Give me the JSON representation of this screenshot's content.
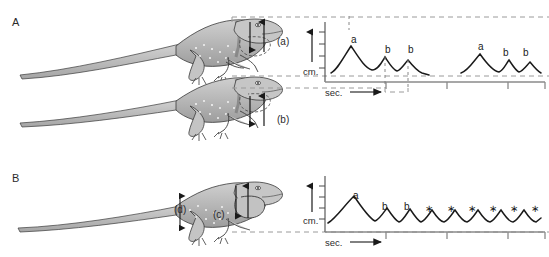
{
  "figure": {
    "background": "#ffffff",
    "ink": "#1a1a1a"
  },
  "panels": [
    {
      "id": "A",
      "label": "A",
      "lizards": [
        {
          "posture_label": "(a)",
          "description": "lizard-high-posture-with-dewlap-outline"
        },
        {
          "posture_label": "(b)",
          "description": "lizard-low-posture-with-dewlap-outline"
        }
      ]
    },
    {
      "id": "B",
      "label": "B",
      "lizards": [
        {
          "posture_label": "(d)",
          "dewlap_label": "(c)",
          "description": "lizard-body-height-and-dewlap-labelled"
        }
      ]
    }
  ],
  "labels": {
    "panel_a": "A",
    "panel_b": "B",
    "displacement_a": "(a)",
    "displacement_b": "(b)",
    "body_height_d": "(d)",
    "dewlap_c": "(c)"
  },
  "charts": {
    "top": {
      "ylabel": "cm.",
      "xlabel": "sec.",
      "xlabel_arrow": "→"
    },
    "bottom": {
      "ylabel": "cm.",
      "xlabel": "sec.",
      "xlabel_arrow": "→"
    }
  },
  "chart_data": [
    {
      "id": "top-trace",
      "type": "line",
      "title": "",
      "xlabel": "sec.",
      "ylabel": "cm.",
      "grid": false,
      "legend": null,
      "axis_origin_px": [
        325,
        82
      ],
      "y_ticks": 4,
      "x_ticks": [
        386,
        447,
        508
      ],
      "peak_labels": [
        "a",
        "b",
        "b",
        "a",
        "b",
        "b"
      ],
      "annotations": [
        {
          "text": "a",
          "x": 351,
          "y": 34,
          "group": 1
        },
        {
          "text": "b",
          "x": 385,
          "y": 44,
          "group": 1
        },
        {
          "text": "b",
          "x": 408,
          "y": 44,
          "group": 1
        },
        {
          "text": "a",
          "x": 478,
          "y": 41,
          "group": 2
        },
        {
          "text": "b",
          "x": 503,
          "y": 47,
          "group": 2
        },
        {
          "text": "b",
          "x": 523,
          "y": 47,
          "group": 2
        }
      ],
      "series": [
        {
          "name": "bob-display-burst-1",
          "points": [
            [
              332,
              72
            ],
            [
              338,
              66
            ],
            [
              344,
              55
            ],
            [
              351,
              46
            ],
            [
              358,
              55
            ],
            [
              365,
              66
            ],
            [
              372,
              70
            ],
            [
              379,
              66
            ],
            [
              385,
              57
            ],
            [
              391,
              66
            ],
            [
              397,
              71
            ],
            [
              403,
              67
            ],
            [
              408,
              60
            ],
            [
              414,
              67
            ],
            [
              421,
              72
            ],
            [
              428,
              74
            ]
          ]
        },
        {
          "name": "bob-display-burst-2",
          "points": [
            [
              462,
              72
            ],
            [
              468,
              69
            ],
            [
              474,
              61
            ],
            [
              480,
              54
            ],
            [
              487,
              62
            ],
            [
              493,
              70
            ],
            [
              499,
              72
            ],
            [
              504,
              66
            ],
            [
              509,
              60
            ],
            [
              514,
              67
            ],
            [
              519,
              72
            ],
            [
              524,
              67
            ],
            [
              529,
              62
            ],
            [
              534,
              68
            ],
            [
              540,
              72
            ]
          ]
        }
      ],
      "dashed_guides": [
        {
          "name": "guide-b1",
          "x": 385,
          "y_top": 57,
          "y_bottom": 92
        },
        {
          "name": "guide-b2",
          "x": 408,
          "y_top": 60,
          "y_bottom": 92
        }
      ]
    },
    {
      "id": "bottom-trace",
      "type": "line",
      "title": "",
      "xlabel": "sec.",
      "ylabel": "cm.",
      "grid": false,
      "legend": null,
      "axis_origin_px": [
        325,
        232
      ],
      "y_ticks": 4,
      "x_ticks": [
        386,
        447,
        508
      ],
      "peak_labels": [
        "a",
        "b",
        "b",
        "*",
        "*",
        "*",
        "*",
        "*",
        "*",
        "*",
        "*",
        "*",
        "*"
      ],
      "annotations": [
        {
          "text": "a",
          "x": 353,
          "y": 190
        },
        {
          "text": "b",
          "x": 382,
          "y": 201
        },
        {
          "text": "b",
          "x": 404,
          "y": 201
        },
        {
          "text": "∗",
          "x": 425,
          "y": 203
        },
        {
          "text": "∗",
          "x": 447,
          "y": 203
        },
        {
          "text": "∗",
          "x": 468,
          "y": 203
        },
        {
          "text": "∗",
          "x": 489,
          "y": 203
        },
        {
          "text": "∗",
          "x": 510,
          "y": 203
        },
        {
          "text": "∗",
          "x": 531,
          "y": 203
        }
      ],
      "series": [
        {
          "name": "bob-display-continuous",
          "points": [
            [
              328,
              222
            ],
            [
              334,
              216
            ],
            [
              341,
              208
            ],
            [
              348,
              200
            ],
            [
              355,
              196
            ],
            [
              362,
              205
            ],
            [
              369,
              214
            ],
            [
              375,
              220
            ],
            [
              381,
              214
            ],
            [
              387,
              208
            ],
            [
              393,
              215
            ],
            [
              399,
              221
            ],
            [
              404,
              215
            ],
            [
              409,
              209
            ],
            [
              415,
              216
            ],
            [
              421,
              221
            ],
            [
              426,
              215
            ],
            [
              431,
              209
            ],
            [
              436,
              216
            ],
            [
              442,
              221
            ],
            [
              447,
              215
            ],
            [
              452,
              209
            ],
            [
              458,
              216
            ],
            [
              463,
              221
            ],
            [
              468,
              215
            ],
            [
              474,
              209
            ],
            [
              479,
              216
            ],
            [
              484,
              221
            ],
            [
              490,
              215
            ],
            [
              495,
              209
            ],
            [
              500,
              216
            ],
            [
              506,
              221
            ],
            [
              511,
              215
            ],
            [
              516,
              209
            ],
            [
              522,
              216
            ],
            [
              527,
              221
            ],
            [
              532,
              215
            ],
            [
              537,
              209
            ],
            [
              541,
              214
            ]
          ]
        }
      ],
      "dashed_guides": []
    }
  ],
  "connectors": {
    "dashed_color": "#9a9a9a",
    "lines": [
      {
        "name": "connector-top-lizard-to-chart"
      },
      {
        "name": "connector-mid-lizard-to-chart"
      },
      {
        "name": "connector-bottom-lizard-to-chart"
      }
    ]
  }
}
